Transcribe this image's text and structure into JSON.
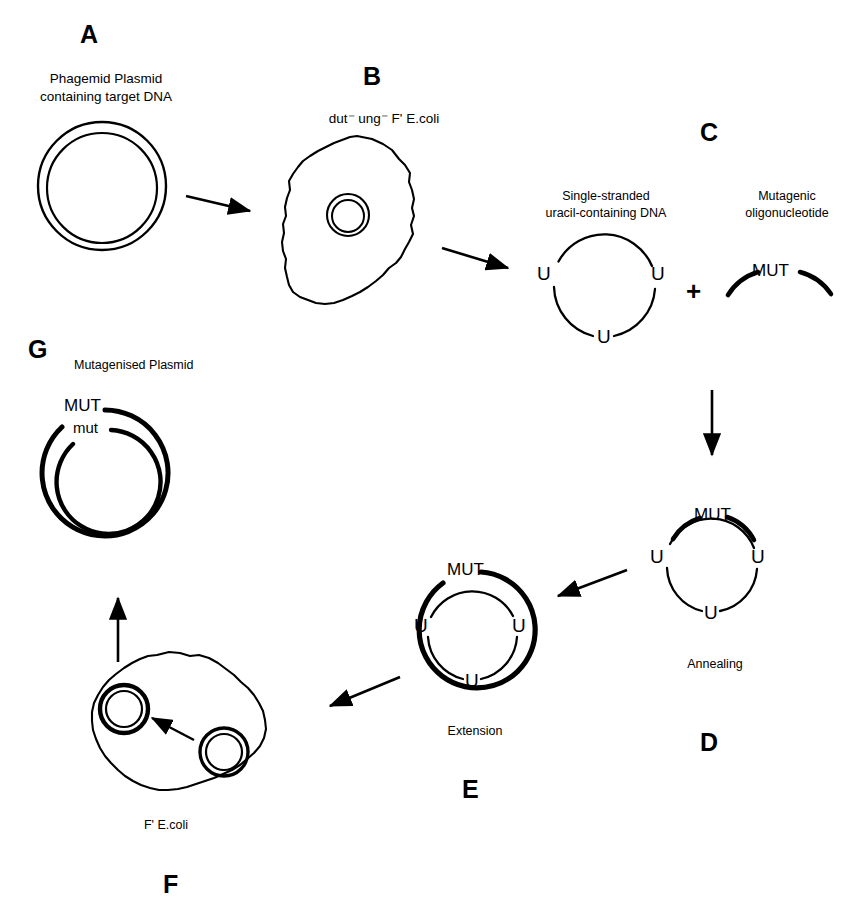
{
  "figure": {
    "background_color": "#ffffff",
    "stroke_color": "#000000",
    "width": 862,
    "height": 912
  },
  "panels": [
    {
      "id": "A",
      "letter": "A",
      "caption_line1": "Phagemid Plasmid",
      "caption_line2": "containing target DNA",
      "icon": "double-circle-plasmid"
    },
    {
      "id": "B",
      "letter": "B",
      "caption_line1": "dut",
      "caption_sup1": "-",
      "caption_line2": "ung",
      "caption_sup2": "-",
      "caption_line3": "F' E.coli",
      "caption_full": "dut⁻ ung⁻ F' E.coli",
      "icon": "ecoli-cell-with-plasmid"
    },
    {
      "id": "C",
      "letter": "C",
      "caption_line1": "Single-stranded",
      "caption_line2": "uracil-containing DNA",
      "caption_right_line1": "Mutagenic",
      "caption_right_line2": "oligonucleotide",
      "plus": "+",
      "uracil_labels": [
        "U",
        "U",
        "U"
      ],
      "oligo_label": "MUT",
      "icon": "ssdna-circle-plus-oligo"
    },
    {
      "id": "D",
      "letter": "D",
      "caption_line1": "Annealing",
      "uracil_labels": [
        "U",
        "U",
        "U"
      ],
      "oligo_label": "MUT",
      "icon": "annealed-circle"
    },
    {
      "id": "E",
      "letter": "E",
      "caption_line1": "Extension",
      "uracil_labels": [
        "U",
        "U",
        "U"
      ],
      "oligo_label": "MUT",
      "icon": "extended-double-circle"
    },
    {
      "id": "F",
      "letter": "F",
      "caption_line1": "F' E.coli",
      "icon": "ecoli-cell-two-plasmids"
    },
    {
      "id": "G",
      "letter": "G",
      "caption_line1": "Mutagenised Plasmid",
      "outer_label": "MUT",
      "inner_label": "mut",
      "icon": "mutagenised-double-circle"
    }
  ],
  "arrows": [
    {
      "name": "arrow-a-to-b",
      "direction": "right"
    },
    {
      "name": "arrow-b-to-c",
      "direction": "right"
    },
    {
      "name": "arrow-c-to-d",
      "direction": "down"
    },
    {
      "name": "arrow-d-to-e",
      "direction": "left"
    },
    {
      "name": "arrow-e-to-f",
      "direction": "down-left"
    },
    {
      "name": "arrow-f-to-g",
      "direction": "up"
    },
    {
      "name": "arrow-inside-cell-f",
      "direction": "up-left"
    }
  ]
}
